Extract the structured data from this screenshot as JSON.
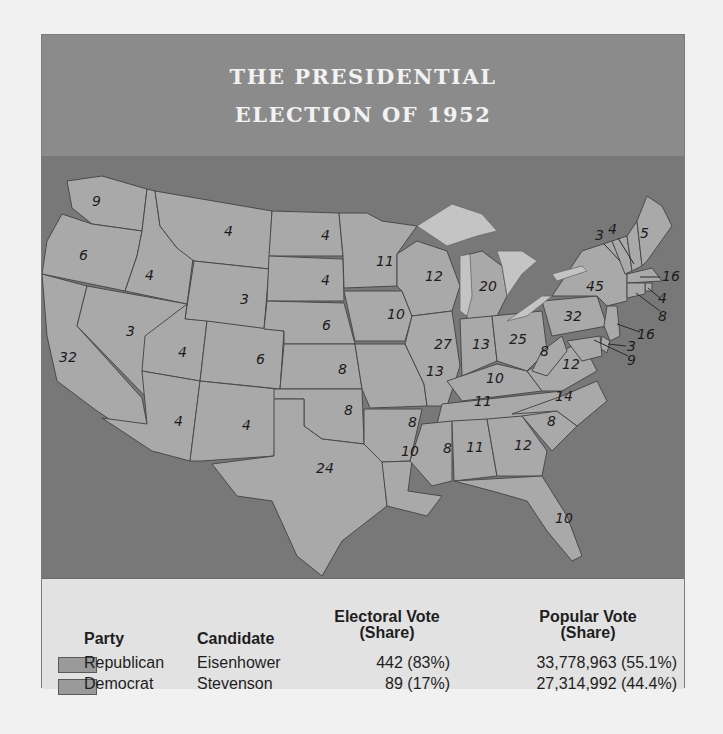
{
  "title": {
    "line1": "THE PRESIDENTIAL",
    "line2": "ELECTION OF 1952"
  },
  "map": {
    "states": [
      {
        "state": "Washington",
        "ev": "9"
      },
      {
        "state": "Oregon",
        "ev": "6"
      },
      {
        "state": "California",
        "ev": "32"
      },
      {
        "state": "Idaho",
        "ev": "4"
      },
      {
        "state": "Nevada",
        "ev": "3"
      },
      {
        "state": "Montana",
        "ev": "4"
      },
      {
        "state": "Wyoming",
        "ev": "3"
      },
      {
        "state": "Utah",
        "ev": "4"
      },
      {
        "state": "Colorado",
        "ev": "6"
      },
      {
        "state": "Arizona",
        "ev": "4"
      },
      {
        "state": "New Mexico",
        "ev": "4"
      },
      {
        "state": "North Dakota",
        "ev": "4"
      },
      {
        "state": "South Dakota",
        "ev": "4"
      },
      {
        "state": "Nebraska",
        "ev": "6"
      },
      {
        "state": "Kansas",
        "ev": "8"
      },
      {
        "state": "Oklahoma",
        "ev": "8"
      },
      {
        "state": "Texas",
        "ev": "24"
      },
      {
        "state": "Minnesota",
        "ev": "11"
      },
      {
        "state": "Iowa",
        "ev": "10"
      },
      {
        "state": "Missouri",
        "ev": "13"
      },
      {
        "state": "Arkansas",
        "ev": "8"
      },
      {
        "state": "Louisiana",
        "ev": "10"
      },
      {
        "state": "Wisconsin",
        "ev": "12"
      },
      {
        "state": "Illinois",
        "ev": "27"
      },
      {
        "state": "Michigan",
        "ev": "20"
      },
      {
        "state": "Indiana",
        "ev": "13"
      },
      {
        "state": "Ohio",
        "ev": "25"
      },
      {
        "state": "Kentucky",
        "ev": "10"
      },
      {
        "state": "Tennessee",
        "ev": "11"
      },
      {
        "state": "Mississippi",
        "ev": "8"
      },
      {
        "state": "Alabama",
        "ev": "11"
      },
      {
        "state": "Georgia",
        "ev": "12"
      },
      {
        "state": "Florida",
        "ev": "10"
      },
      {
        "state": "South Carolina",
        "ev": "8"
      },
      {
        "state": "North Carolina",
        "ev": "14"
      },
      {
        "state": "Virginia",
        "ev": "12"
      },
      {
        "state": "West Virginia",
        "ev": "8"
      },
      {
        "state": "Pennsylvania",
        "ev": "32"
      },
      {
        "state": "New York",
        "ev": "45"
      },
      {
        "state": "Vermont",
        "ev": "3"
      },
      {
        "state": "New Hampshire",
        "ev": "4"
      },
      {
        "state": "Maine",
        "ev": "5"
      },
      {
        "state": "Massachusetts",
        "ev": "16"
      },
      {
        "state": "Rhode Island",
        "ev": "4"
      },
      {
        "state": "Connecticut",
        "ev": "8"
      },
      {
        "state": "New Jersey",
        "ev": "16"
      },
      {
        "state": "Delaware",
        "ev": "3"
      },
      {
        "state": "Maryland",
        "ev": "9"
      }
    ]
  },
  "legend": {
    "headers": {
      "party": "Party",
      "candidate": "Candidate",
      "electoral_line1": "Electoral Vote",
      "electoral_line2": "(Share)",
      "popular_line1": "Popular Vote",
      "popular_line2": "(Share)"
    },
    "rows": [
      {
        "party": "Republican",
        "candidate": "Eisenhower",
        "electoral": "442 (83%)",
        "popular": "33,778,963 (55.1%)",
        "swatch_color": "#9a9a9a"
      },
      {
        "party": "Democrat",
        "candidate": "Stevenson",
        "electoral": "89 (17%)",
        "popular": "27,314,992 (44.4%)",
        "swatch_color": "#9a9a9a"
      }
    ]
  },
  "colors": {
    "title_band": "#8b8b8b",
    "water": "#787878",
    "land": "#a9a9a9",
    "lakes": "#c4c4c4",
    "legend_bg": "#e2e2e2"
  }
}
